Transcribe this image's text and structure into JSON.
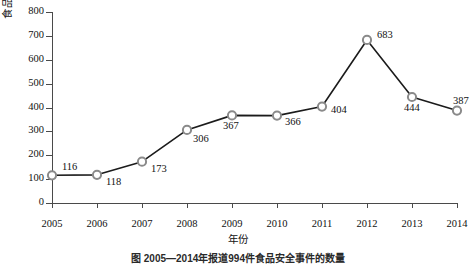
{
  "chart_data": {
    "type": "line",
    "title": "",
    "xlabel": "年份",
    "ylabel": "食品安全事件数量(起)",
    "categories": [
      "2005",
      "2006",
      "2007",
      "2008",
      "2009",
      "2010",
      "2011",
      "2012",
      "2013",
      "2014"
    ],
    "values": [
      116,
      118,
      173,
      306,
      367,
      366,
      404,
      683,
      444,
      387
    ],
    "point_labels": [
      "116",
      "118",
      "173",
      "306",
      "367",
      "366",
      "404",
      "683",
      "444",
      "387"
    ],
    "ylim": [
      0,
      800
    ],
    "yticks": [
      0,
      100,
      200,
      300,
      400,
      500,
      600,
      700,
      800
    ],
    "ytick_labels": [
      "0",
      "100",
      "200",
      "300",
      "400",
      "500",
      "600",
      "700",
      "800"
    ],
    "grid": false,
    "legend": "none",
    "marker": "circle-open",
    "colors": {
      "line": "#1b1b1b",
      "marker_edge": "#8a8a8a",
      "marker_fill": "#ffffff",
      "axis": "#4a4a4a",
      "text": "#111111",
      "background": "#ffffff"
    }
  },
  "caption": "图   2005—2014年报道994件食品安全事件的数量"
}
